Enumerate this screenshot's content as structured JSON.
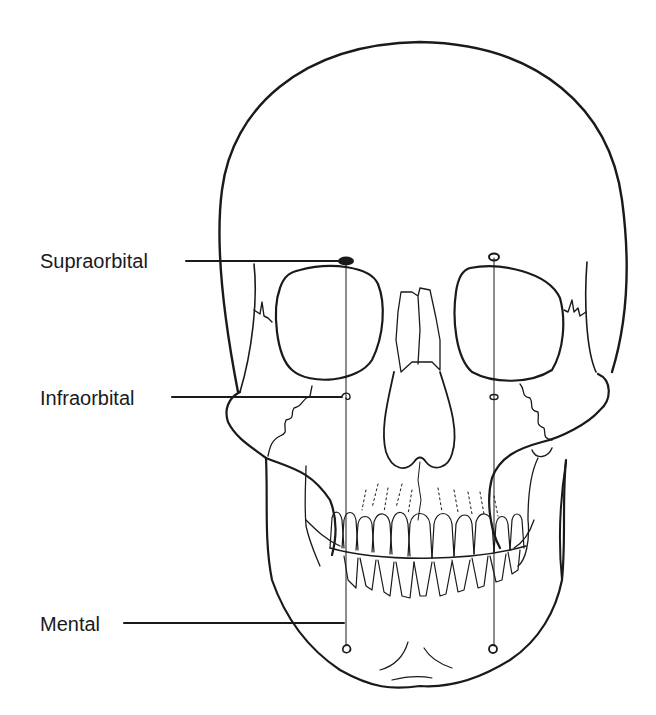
{
  "figure": {
    "colors": {
      "line": "#1a1a1a",
      "background": "#ffffff"
    },
    "labels": [
      {
        "id": "supraorbital",
        "text": "Supraorbital"
      },
      {
        "id": "infraorbital",
        "text": "Infraorbital"
      },
      {
        "id": "mental",
        "text": "Mental"
      }
    ]
  }
}
